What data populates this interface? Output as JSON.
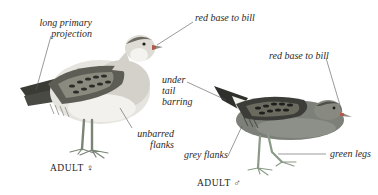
{
  "figure": {
    "female": {
      "caption": "ADULT ♀",
      "labels": {
        "primary_projection_line1": "long primary",
        "primary_projection_line2": "projection",
        "bill": "red base to bill",
        "flanks_line1": "unbarred",
        "flanks_line2": "flanks"
      }
    },
    "male": {
      "caption": "ADULT ♂",
      "labels": {
        "undertail_line1": "under",
        "undertail_line2": "tail",
        "undertail_line3": "barring",
        "bill": "red base to bill",
        "flanks": "grey flanks",
        "legs": "green legs"
      }
    },
    "colors": {
      "background": "#ffffff",
      "text": "#2a2a2a",
      "leader_line": "#555555",
      "female_back": "#5a5a52",
      "female_breast": "#d8d6cf",
      "female_belly": "#eeeeea",
      "male_body": "#7d8079",
      "male_back": "#3c3d38",
      "legs": "#8a9a86",
      "bill_base": "#b55a4a"
    }
  }
}
